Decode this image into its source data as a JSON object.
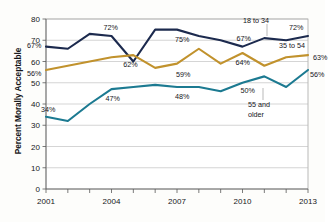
{
  "chart_data": {
    "type": "line",
    "title": "",
    "xlabel": "",
    "ylabel": "Percent Morally Acceptable",
    "ylim": [
      0,
      80
    ],
    "ytick_step": 10,
    "yticks": [
      "80",
      "70",
      "60",
      "50",
      "40",
      "30",
      "20",
      "10",
      "0"
    ],
    "x": [
      2001,
      2002,
      2003,
      2004,
      2005,
      2006,
      2007,
      2008,
      2009,
      2010,
      2011,
      2012,
      2013
    ],
    "xtick_labels": [
      "2001",
      "2004",
      "2007",
      "2010",
      "2013"
    ],
    "xtick_values": [
      2001,
      2004,
      2007,
      2010,
      2013
    ],
    "grid": "horizontal",
    "legend_position": "inline-right",
    "series": [
      {
        "name": "18 to 34",
        "color": "#1c2a4e",
        "values": [
          67,
          66,
          73,
          72,
          60,
          75,
          75,
          72,
          70,
          67,
          71,
          70,
          72
        ]
      },
      {
        "name": "35 to 54",
        "color": "#c1922d",
        "values": [
          56,
          58,
          60,
          62,
          63,
          57,
          59,
          66,
          59,
          64,
          58,
          62,
          63
        ]
      },
      {
        "name": "55 and older",
        "color": "#1c7a91",
        "values": [
          34,
          32,
          40,
          47,
          48,
          49,
          48,
          48,
          46,
          50,
          53,
          48,
          56
        ]
      }
    ],
    "point_labels": [
      {
        "series": "18 to 34",
        "x": 2001,
        "value": 67,
        "text": "67%"
      },
      {
        "series": "18 to 34",
        "x": 2004,
        "value": 72,
        "text": "72%"
      },
      {
        "series": "18 to 34",
        "x": 2007,
        "value": 75,
        "text": "75%"
      },
      {
        "series": "18 to 34",
        "x": 2010,
        "value": 67,
        "text": "67%"
      },
      {
        "series": "18 to 34",
        "x": 2013,
        "value": 72,
        "text": "72%"
      },
      {
        "series": "35 to 54",
        "x": 2001,
        "value": 56,
        "text": "56%"
      },
      {
        "series": "35 to 54",
        "x": 2005,
        "value": 62,
        "text": "62%"
      },
      {
        "series": "35 to 54",
        "x": 2007,
        "value": 59,
        "text": "59%"
      },
      {
        "series": "35 to 54",
        "x": 2010,
        "value": 64,
        "text": "64%"
      },
      {
        "series": "35 to 54",
        "x": 2013,
        "value": 63,
        "text": "63%"
      },
      {
        "series": "55 and older",
        "x": 2001,
        "value": 34,
        "text": "34%"
      },
      {
        "series": "55 and older",
        "x": 2004,
        "value": 47,
        "text": "47%"
      },
      {
        "series": "55 and older",
        "x": 2007,
        "value": 48,
        "text": "48%"
      },
      {
        "series": "55 and older",
        "x": 2010,
        "value": 50,
        "text": "50%"
      },
      {
        "series": "55 and older",
        "x": 2013,
        "value": 56,
        "text": "56%"
      }
    ],
    "annotations": [
      {
        "text": "18 to 34",
        "series": "18 to 34"
      },
      {
        "text": "35 to 54",
        "series": "35 to 54"
      },
      {
        "text": "55 and older",
        "series": "55 and older"
      }
    ]
  },
  "labels": {
    "point_67_a": "67%",
    "point_72_a": "72%",
    "point_75": "75%",
    "point_67_b": "67%",
    "point_72_b": "72%",
    "point_56_a": "56%",
    "point_62": "62%",
    "point_59": "59%",
    "point_64": "64%",
    "point_63": "63%",
    "point_34": "34%",
    "point_47": "47%",
    "point_48": "48%",
    "point_50": "50%",
    "point_56_b": "56%",
    "series_young": "18 to 34",
    "series_mid": "35 to 54",
    "series_old_line1": "55 and",
    "series_old_line2": "older"
  }
}
